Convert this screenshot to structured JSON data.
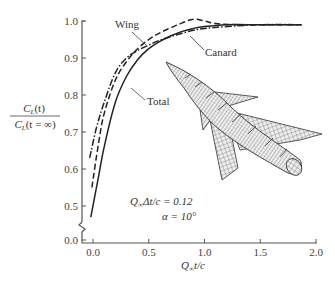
{
  "chart_data": {
    "type": "line",
    "title": "",
    "xlabel": "Q∞t/c",
    "ylabel_num": "C_L(t)",
    "ylabel_den": "C_L(t = ∞)",
    "xlim": [
      -0.1,
      2.0
    ],
    "ylim": [
      0.0,
      1.0
    ],
    "y_axis_break": "between 0.0 and 0.5",
    "x_ticks": [
      "0.0",
      "0.5",
      "1.0",
      "1.5",
      "2.0"
    ],
    "y_ticks": [
      "0.0",
      "0.5",
      "0.6",
      "0.7",
      "0.8",
      "0.9",
      "1.0"
    ],
    "grid": false,
    "series": [
      {
        "name": "Total",
        "style": "solid",
        "x": [
          -0.02,
          0.05,
          0.1,
          0.2,
          0.3,
          0.4,
          0.5,
          0.6,
          0.7,
          0.8,
          0.9,
          1.0,
          1.2,
          1.5,
          1.87
        ],
        "y": [
          0.47,
          0.58,
          0.66,
          0.78,
          0.85,
          0.895,
          0.925,
          0.945,
          0.96,
          0.972,
          0.98,
          0.985,
          0.99,
          0.99,
          0.99
        ]
      },
      {
        "name": "Wing",
        "style": "dashed",
        "x": [
          -0.01,
          0.05,
          0.1,
          0.2,
          0.3,
          0.4,
          0.5,
          0.6,
          0.7,
          0.8,
          0.9,
          1.0,
          1.1,
          1.3,
          1.5,
          1.87
        ],
        "y": [
          0.55,
          0.67,
          0.75,
          0.84,
          0.89,
          0.925,
          0.95,
          0.968,
          0.982,
          0.995,
          1.005,
          1.0,
          0.993,
          0.99,
          0.99,
          0.99
        ]
      },
      {
        "name": "Canard",
        "style": "dash-dot",
        "x": [
          -0.03,
          0.03,
          0.1,
          0.2,
          0.3,
          0.4,
          0.5,
          0.6,
          0.7,
          0.8,
          0.9,
          1.0,
          1.2,
          1.5,
          1.87
        ],
        "y": [
          0.63,
          0.71,
          0.78,
          0.86,
          0.9,
          0.92,
          0.935,
          0.948,
          0.958,
          0.967,
          0.975,
          0.98,
          0.985,
          0.99,
          0.99
        ]
      }
    ],
    "annotations": [
      {
        "text": "Wing",
        "points_to": "Wing curve"
      },
      {
        "text": "Canard",
        "points_to": "Canard curve"
      },
      {
        "text": "Total",
        "points_to": "Total curve"
      },
      {
        "text": "Q∞Δt/c = 0.12"
      },
      {
        "text": "α = 10°"
      }
    ],
    "legend": "inline labels",
    "inset": "3D wireframe mesh of a canard-wing aircraft"
  },
  "labels": {
    "wing": "Wing",
    "canard": "Canard",
    "total": "Total",
    "param1_lhs": "Q",
    "param1_sub": "∞",
    "param1_rest": "Δt/c = 0.12",
    "param2": "α = 10°",
    "xlabel_q": "Q",
    "xlabel_sub": "∞",
    "xlabel_rest": "t/c",
    "ylabel_num": "C",
    "ylabel_num_sub": "L",
    "ylabel_num_rest": "(t)",
    "ylabel_den": "C",
    "ylabel_den_sub": "L",
    "ylabel_den_rest": "(t = ∞)"
  }
}
